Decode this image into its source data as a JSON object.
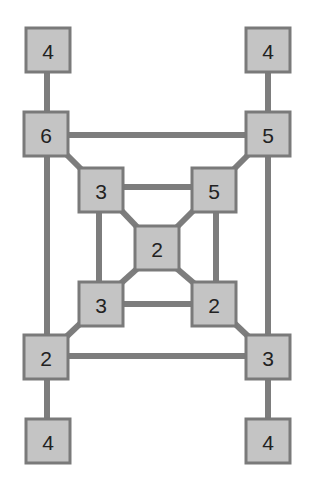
{
  "diagram": {
    "type": "graph",
    "nodes": [
      {
        "id": "n_tl4",
        "label": "4",
        "x": 48,
        "y": 50
      },
      {
        "id": "n_tr4",
        "label": "4",
        "x": 268,
        "y": 50
      },
      {
        "id": "n_6",
        "label": "6",
        "x": 46,
        "y": 134
      },
      {
        "id": "n_5o",
        "label": "5",
        "x": 268,
        "y": 134
      },
      {
        "id": "n_3i",
        "label": "3",
        "x": 101,
        "y": 190
      },
      {
        "id": "n_5i",
        "label": "5",
        "x": 214,
        "y": 190
      },
      {
        "id": "n_2c",
        "label": "2",
        "x": 157,
        "y": 248
      },
      {
        "id": "n_3b",
        "label": "3",
        "x": 101,
        "y": 303
      },
      {
        "id": "n_2b",
        "label": "2",
        "x": 214,
        "y": 303
      },
      {
        "id": "n_2o",
        "label": "2",
        "x": 46,
        "y": 357
      },
      {
        "id": "n_3o",
        "label": "3",
        "x": 268,
        "y": 357
      },
      {
        "id": "n_bl4",
        "label": "4",
        "x": 48,
        "y": 441
      },
      {
        "id": "n_br4",
        "label": "4",
        "x": 268,
        "y": 441
      }
    ],
    "edges": [
      [
        "n_tl4",
        "n_6"
      ],
      [
        "n_tr4",
        "n_5o"
      ],
      [
        "n_6",
        "n_5o"
      ],
      [
        "n_6",
        "n_2o"
      ],
      [
        "n_5o",
        "n_3o"
      ],
      [
        "n_2o",
        "n_3o"
      ],
      [
        "n_6",
        "n_3i"
      ],
      [
        "n_5o",
        "n_5i"
      ],
      [
        "n_2o",
        "n_3b"
      ],
      [
        "n_3o",
        "n_2b"
      ],
      [
        "n_3i",
        "n_5i"
      ],
      [
        "n_3i",
        "n_3b"
      ],
      [
        "n_5i",
        "n_2b"
      ],
      [
        "n_3b",
        "n_2b"
      ],
      [
        "n_3i",
        "n_2c"
      ],
      [
        "n_5i",
        "n_2c"
      ],
      [
        "n_3b",
        "n_2c"
      ],
      [
        "n_2b",
        "n_2c"
      ],
      [
        "n_2o",
        "n_bl4"
      ],
      [
        "n_3o",
        "n_br4"
      ]
    ],
    "colors": {
      "node_fill": "#c4c4c4",
      "node_border": "#7a7a7a",
      "edge": "#7d7d7d",
      "text": "#222222"
    }
  }
}
